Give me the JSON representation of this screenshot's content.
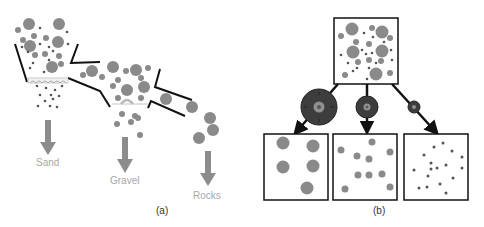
{
  "panel_a": {
    "caption": "(a)",
    "outputs": [
      {
        "label": "Sand"
      },
      {
        "label": "Gravel"
      },
      {
        "label": "Rocks"
      }
    ]
  },
  "panel_b": {
    "caption": "(b)",
    "filters": [
      "large-sieve",
      "medium-sieve",
      "small-sieve"
    ],
    "output_boxes": [
      "large-particles",
      "medium-particles",
      "small-particles"
    ]
  },
  "colors": {
    "particle": "#8a8a8a",
    "small_particle": "#5c5c5c",
    "line": "#111111",
    "arrow_gray": "#8c8c8c",
    "label_gray": "#a8a8a8",
    "sieve_dark": "#3a3a3a"
  }
}
